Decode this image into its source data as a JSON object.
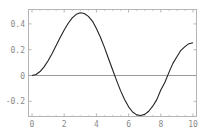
{
  "chart_data": {
    "type": "line",
    "title": "",
    "xlabel": "",
    "ylabel": "",
    "xlim": [
      0,
      10
    ],
    "ylim": [
      -0.32,
      0.5
    ],
    "grid": false,
    "legend": null,
    "x_ticks": [
      "0",
      "2",
      "4",
      "6",
      "8",
      "10"
    ],
    "y_ticks": [
      "0.4",
      "0.2",
      "0",
      "-0.2"
    ],
    "x_tick_values": [
      0,
      2,
      4,
      6,
      8,
      10
    ],
    "y_tick_values": [
      0.4,
      0.2,
      0,
      -0.2
    ],
    "reference_line": {
      "y": 0,
      "color": "#9a9a9a"
    },
    "series": [
      {
        "name": "curve",
        "color": "#222222",
        "x": [
          0,
          0.25,
          0.5,
          0.75,
          1.0,
          1.25,
          1.5,
          1.75,
          2.0,
          2.25,
          2.5,
          2.75,
          3.0,
          3.25,
          3.5,
          3.75,
          4.0,
          4.25,
          4.5,
          4.75,
          5.0,
          5.25,
          5.5,
          5.75,
          6.0,
          6.25,
          6.5,
          6.75,
          7.0,
          7.25,
          7.5,
          7.75,
          8.0,
          8.25,
          8.5,
          8.75,
          9.0,
          9.25,
          9.5,
          9.75,
          10.0
        ],
        "values": [
          0.0,
          0.0078,
          0.0306,
          0.0671,
          0.1149,
          0.1711,
          0.2321,
          0.294,
          0.3528,
          0.4049,
          0.4461,
          0.4744,
          0.4861,
          0.4802,
          0.4586,
          0.4217,
          0.3641,
          0.2966,
          0.2179,
          0.1316,
          0.0466,
          -0.0381,
          -0.1173,
          -0.1858,
          -0.2429,
          -0.283,
          -0.3052,
          -0.3107,
          -0.3014,
          -0.2771,
          -0.2381,
          -0.1873,
          -0.113,
          -0.0547,
          0.0223,
          0.0939,
          0.1448,
          0.1954,
          0.2235,
          0.2467,
          0.2546
        ]
      }
    ]
  }
}
